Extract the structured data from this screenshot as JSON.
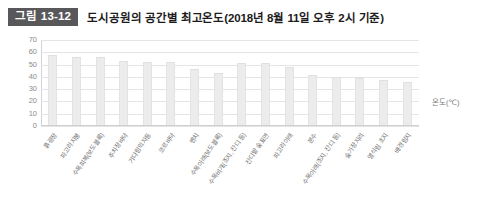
{
  "header": {
    "tag": "그림 13-12",
    "title": "도시공원의 공간별 최고온도(2018년 8월 11일 오후 2시 기준)"
  },
  "unit_label": "온도(℃)",
  "colors": {
    "tag_background": "#58585a",
    "tag_text": "#ffffff",
    "title_text": "#1b1b1b",
    "bar_fill": "#ececec",
    "gridline": "#e4e4e4",
    "axis_text": "#8b8b8b"
  },
  "chart_data": {
    "type": "bar",
    "title": "도시공원의 공간별 최고온도(2018년 8월 11일 오후 2시 기준)",
    "xlabel": "",
    "ylabel": "온도(℃)",
    "ylim": [
      0,
      70
    ],
    "yticks": [
      0,
      10,
      20,
      30,
      40,
      50,
      60,
      70
    ],
    "grid": true,
    "legend": false,
    "categories": [
      "흙광장",
      "파고라지붕",
      "수목피복(보도블록)",
      "주차장바닥",
      "기다림의자등",
      "코르바닥",
      "벤치",
      "수목아래(보도블록)",
      "수목비개(조지, 잔디 등)",
      "잔디밭 숲표면",
      "파고라아래",
      "분수",
      "수목아래(조지, 잔디 등)",
      "숲가장자리",
      "열식림 초지",
      "배경림지"
    ],
    "values": [
      57,
      55,
      55,
      52,
      51,
      51,
      45,
      42,
      50,
      50,
      47,
      40,
      39,
      38,
      36,
      35
    ]
  }
}
